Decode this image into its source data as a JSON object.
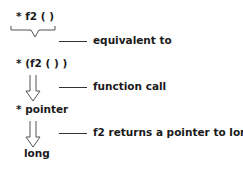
{
  "diagram": {
    "steps": [
      {
        "expression": "* f2 ( )"
      },
      {
        "expression": "* (f2 ( ) )"
      },
      {
        "expression": "* pointer"
      },
      {
        "expression": "long"
      }
    ],
    "annotations": [
      {
        "label": "equivalent to"
      },
      {
        "label": "function call"
      },
      {
        "label": "f2 returns a pointer to long"
      }
    ],
    "colors": {
      "ink": "#1a1a1a",
      "connector": "#333333",
      "arrow": "#555555"
    }
  }
}
